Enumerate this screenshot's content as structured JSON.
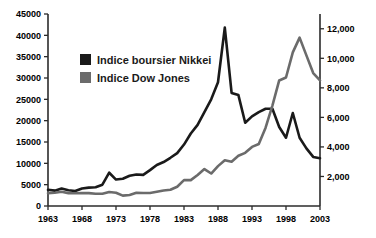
{
  "chart_data": {
    "type": "line",
    "title": "",
    "xlabel": "",
    "ylabel": "",
    "grid": false,
    "legend_position": "inside-top-left",
    "x": [
      1963,
      1964,
      1965,
      1966,
      1967,
      1968,
      1969,
      1970,
      1971,
      1972,
      1973,
      1974,
      1975,
      1976,
      1977,
      1978,
      1979,
      1980,
      1981,
      1982,
      1983,
      1984,
      1985,
      1986,
      1987,
      1988,
      1989,
      1990,
      1991,
      1992,
      1993,
      1994,
      1995,
      1996,
      1997,
      1998,
      1999,
      2000,
      2001,
      2002,
      2003
    ],
    "xtick_labels": [
      "1963",
      "1968",
      "1973",
      "1978",
      "1983",
      "1988",
      "1993",
      "1998",
      "2003"
    ],
    "xtick_values": [
      1963,
      1968,
      1973,
      1978,
      1983,
      1988,
      1993,
      1998,
      2003
    ],
    "xlim": [
      1963,
      2003
    ],
    "axes": [
      {
        "id": "left",
        "side": "left",
        "series": "Indice boursier Nikkei",
        "ylim": [
          0,
          45000
        ],
        "ytick_values": [
          0,
          5000,
          10000,
          15000,
          20000,
          25000,
          30000,
          35000,
          40000,
          45000
        ],
        "ytick_labels": [
          "0",
          "5000",
          "10000",
          "15000",
          "20000",
          "25000",
          "30000",
          "35000",
          "40000",
          "45000"
        ]
      },
      {
        "id": "right",
        "side": "right",
        "series": "Indice Dow Jones",
        "ylim": [
          0,
          13000
        ],
        "ytick_values": [
          2000,
          4000,
          6000,
          8000,
          10000,
          12000
        ],
        "ytick_labels": [
          "2,000",
          "4,000",
          "6,000",
          "8,000",
          "10,000",
          "12,000"
        ]
      }
    ],
    "series": [
      {
        "name": "Indice boursier Nikkei",
        "axis": "left",
        "color": "#1a1a1a",
        "line_width": 2.6,
        "values": [
          3800,
          3600,
          4100,
          3700,
          3500,
          4100,
          4300,
          4400,
          5000,
          7800,
          6200,
          6400,
          7100,
          7400,
          7300,
          8400,
          9600,
          10300,
          11300,
          12400,
          14400,
          17000,
          19000,
          22000,
          25000,
          29000,
          41800,
          26500,
          26000,
          19500,
          21000,
          22000,
          22800,
          22800,
          18500,
          16000,
          21800,
          16000,
          13500,
          11500,
          11200
        ]
      },
      {
        "name": "Indice Dow Jones",
        "axis": "right",
        "color": "#6b6b6b",
        "line_width": 2.6,
        "values": [
          870,
          900,
          960,
          870,
          860,
          880,
          870,
          830,
          830,
          950,
          900,
          700,
          750,
          900,
          880,
          880,
          960,
          1050,
          1100,
          1300,
          1750,
          1750,
          2100,
          2500,
          2200,
          2700,
          3100,
          3000,
          3400,
          3600,
          4000,
          4200,
          5300,
          6800,
          8500,
          8700,
          10400,
          11400,
          10200,
          9000,
          8500
        ]
      }
    ],
    "legend": [
      {
        "label": "Indice boursier Nikkei",
        "color": "#1a1a1a"
      },
      {
        "label": "Indice Dow Jones",
        "color": "#6b6b6b"
      }
    ]
  }
}
